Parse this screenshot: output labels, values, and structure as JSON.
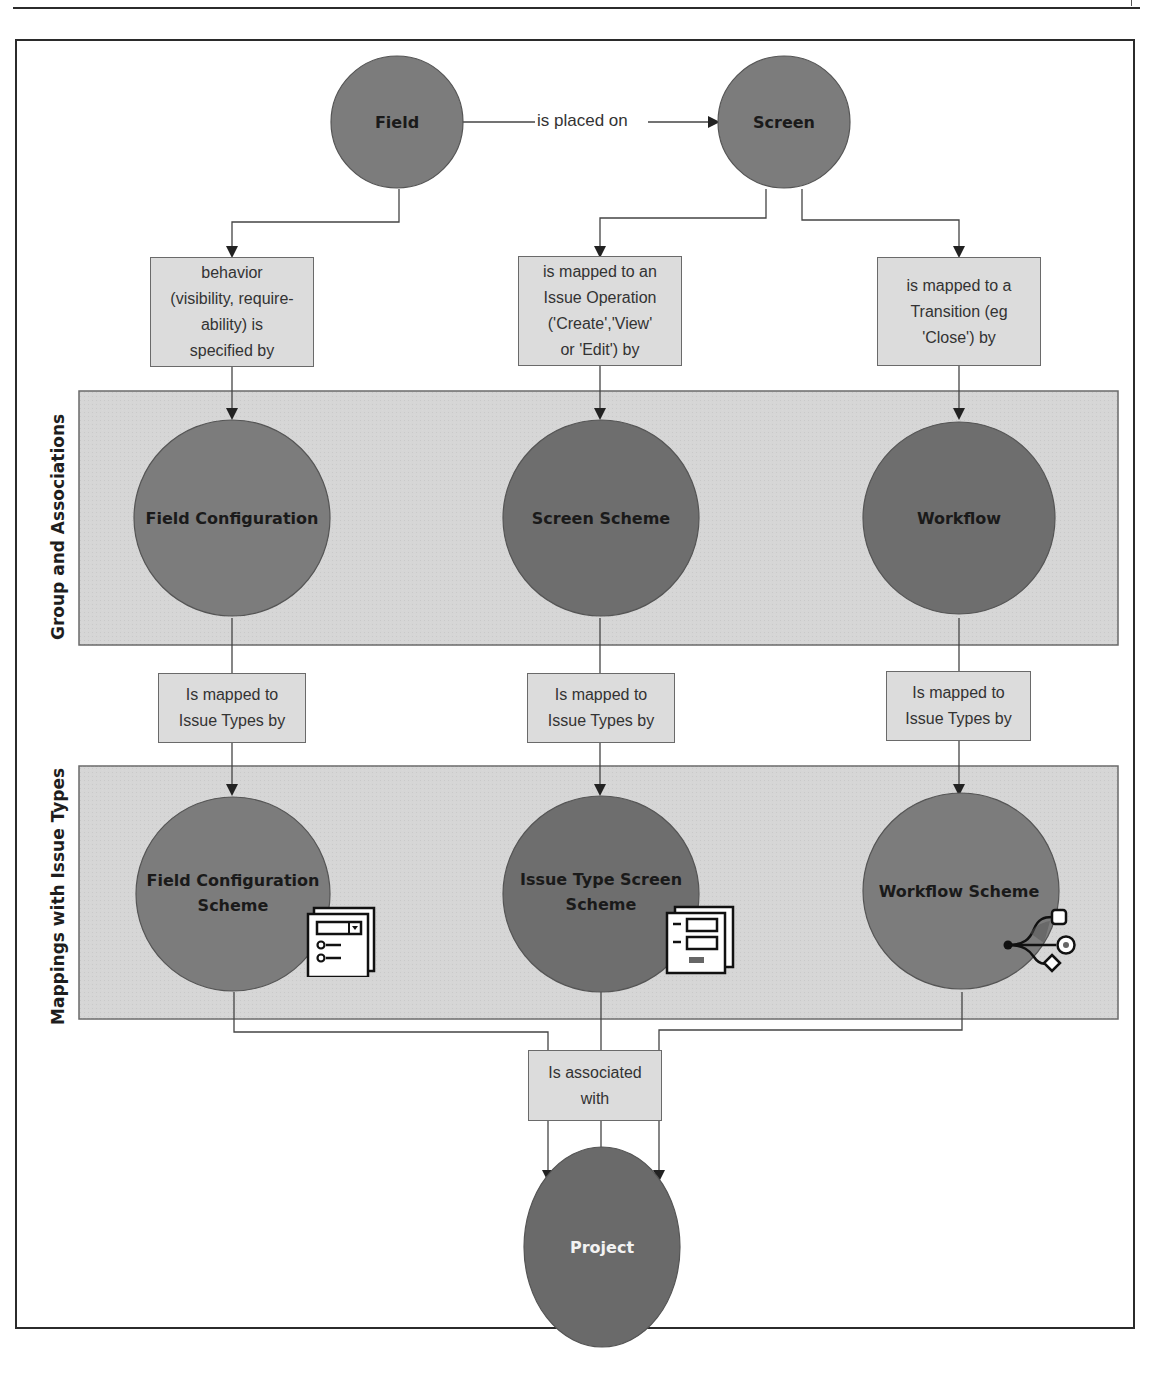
{
  "colors": {
    "node_fill": "#7c7c7c",
    "node_fill_dark": "#6a6a6a",
    "band_fill": "#d6d6d6",
    "box_fill": "#dcdcdc",
    "line": "#444444",
    "frame": "#2b2b2b"
  },
  "bands": {
    "group": {
      "label": "Group and Associations"
    },
    "mappings": {
      "label": "Mappings with Issue Types"
    }
  },
  "nodes": {
    "field": {
      "label": "Field"
    },
    "screen": {
      "label": "Screen"
    },
    "field_configuration": {
      "label": "Field Configuration"
    },
    "screen_scheme": {
      "label": "Screen Scheme"
    },
    "workflow": {
      "label": "Workflow"
    },
    "field_configuration_scheme": {
      "label": "Field Configuration\nScheme",
      "icon": "form-dropdown-icon"
    },
    "issue_type_screen_scheme": {
      "label": "Issue Type Screen\nScheme",
      "icon": "screen-form-icon"
    },
    "workflow_scheme": {
      "label": "Workflow Scheme",
      "icon": "workflow-branch-icon"
    },
    "project": {
      "label": "Project"
    }
  },
  "edges": {
    "field_to_screen": {
      "label": "is placed on"
    },
    "field_behavior": {
      "label": "behavior\n(visibility, require-\nability) is\nspecified by"
    },
    "screen_operation": {
      "label": "is mapped to an\nIssue Operation\n('Create','View'\nor 'Edit') by"
    },
    "screen_transition": {
      "label": "is mapped to a\nTransition (eg\n'Close') by"
    },
    "fc_issue_types": {
      "label": "Is mapped to\nIssue Types by"
    },
    "ss_issue_types": {
      "label": "Is mapped to\nIssue Types by"
    },
    "wf_issue_types": {
      "label": "Is mapped to\nIssue Types by"
    },
    "associated": {
      "label": "Is associated\nwith"
    }
  }
}
